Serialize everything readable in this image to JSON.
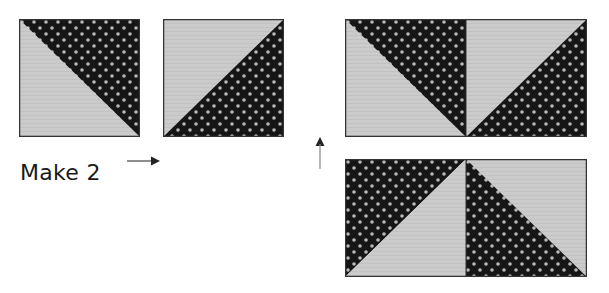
{
  "diagram": {
    "instruction_label": "Make 2",
    "colors": {
      "dark_fabric": "#161616",
      "dot": "#b8b8b8",
      "light_fabric": "#c9c9c9",
      "outline": "#333333",
      "arrow": "#222222"
    },
    "units": [
      {
        "id": "hst-1",
        "description": "Half-square triangle: light lower-left, dark dotted upper-right (diagonal top-left to bottom-right)"
      },
      {
        "id": "hst-2",
        "description": "Half-square triangle: light upper-left, dark dotted lower-right (diagonal bottom-left to top-right)"
      }
    ],
    "assembly": {
      "top_row": [
        "hst-1",
        "hst-2"
      ],
      "bottom_row": [
        "hst-2 rotated (dark upper-left, light lower-right)",
        "hst-1 rotated (dark lower-left, light upper-right)"
      ]
    },
    "arrows": [
      {
        "id": "arrow-right",
        "direction": "right"
      },
      {
        "id": "arrow-up",
        "direction": "up"
      }
    ]
  }
}
